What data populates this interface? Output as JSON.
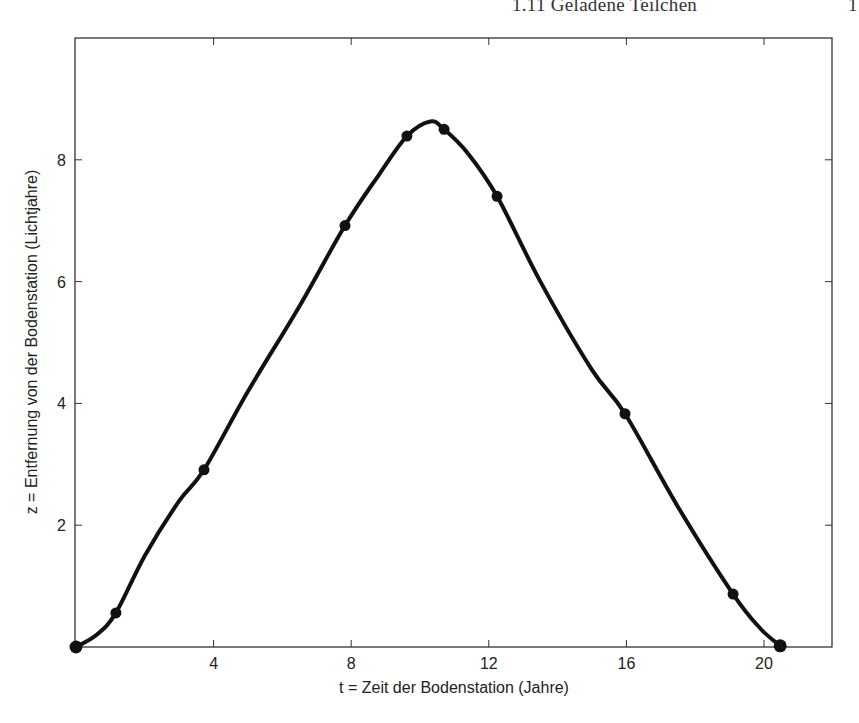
{
  "page": {
    "running_head": "1.11 Geladene Teilchen",
    "page_number": "1"
  },
  "chart_data": {
    "type": "line",
    "title": "",
    "xlabel": "t = Zeit der Bodenstation (Jahre)",
    "ylabel": "z = Entfernung von der Bodenstation (Lichtjahre)",
    "xlim": [
      0,
      21.9
    ],
    "ylim": [
      0,
      10
    ],
    "xticks": [
      4,
      8,
      12,
      16,
      20
    ],
    "yticks": [
      2,
      4,
      6,
      8
    ],
    "xtick_labels": [
      "4",
      "8",
      "12",
      "16",
      "20"
    ],
    "ytick_labels": [
      "2",
      "4",
      "6",
      "8"
    ],
    "grid": false,
    "legend": null,
    "series": [
      {
        "name": "trajectory",
        "style": "smooth curve with markers",
        "color": "#111111",
        "markers": {
          "x": [
            0,
            1.16,
            3.72,
            7.82,
            9.62,
            10.7,
            12.24,
            15.96,
            19.1,
            20.47
          ],
          "y": [
            0,
            0.56,
            2.91,
            6.92,
            8.39,
            8.5,
            7.4,
            3.83,
            0.87,
            0.02
          ]
        },
        "curve": {
          "x": [
            0,
            0.6,
            1.16,
            2.0,
            3.0,
            3.72,
            5.0,
            6.5,
            7.82,
            8.8,
            9.62,
            10.3,
            10.7,
            11.4,
            12.24,
            13.5,
            15.0,
            15.96,
            17.5,
            19.1,
            19.9,
            20.47
          ],
          "y": [
            0,
            0.2,
            0.56,
            1.5,
            2.4,
            2.91,
            4.2,
            5.6,
            6.92,
            7.75,
            8.39,
            8.63,
            8.5,
            8.1,
            7.4,
            6.0,
            4.55,
            3.83,
            2.3,
            0.87,
            0.3,
            0.02
          ]
        }
      }
    ]
  }
}
